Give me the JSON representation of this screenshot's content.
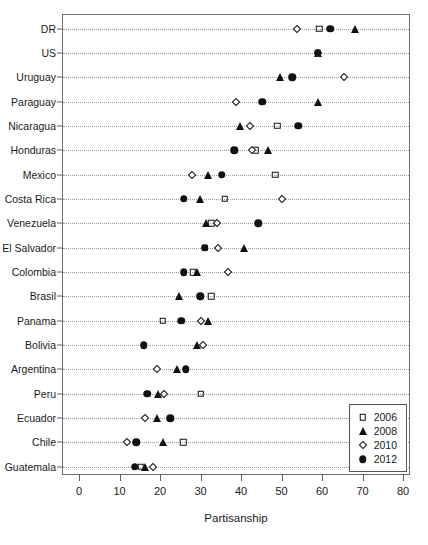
{
  "chart_data": {
    "type": "scatter",
    "title": "",
    "xlabel": "Partisanship",
    "ylabel": "",
    "xlim": [
      0,
      80
    ],
    "xticks": [
      0,
      10,
      20,
      30,
      40,
      50,
      60,
      70,
      80
    ],
    "grid": "horizontal-dotted",
    "legend_position": "bottom-right",
    "categories": [
      "DR",
      "US",
      "Uruguay",
      "Paraguay",
      "Nicaragua",
      "Honduras",
      "Mexico",
      "Costa Rica",
      "Venezuela",
      "El Salvador",
      "Colombia",
      "Brasil",
      "Panama",
      "Bolivia",
      "Argentina",
      "Peru",
      "Ecuador",
      "Chile",
      "Guatemala"
    ],
    "series": [
      {
        "name": "2006",
        "marker": "open-square",
        "values": [
          59.3,
          59.0,
          null,
          null,
          48.9,
          43.7,
          48.4,
          36.0,
          32.6,
          31.1,
          28.1,
          32.6,
          20.7,
          null,
          null,
          30.1,
          null,
          25.7,
          15.3
        ]
      },
      {
        "name": "2008",
        "marker": "filled-triangle",
        "values": [
          68.1,
          59.0,
          49.6,
          59.0,
          39.8,
          46.7,
          31.9,
          29.9,
          31.4,
          40.7,
          29.1,
          24.7,
          31.9,
          29.1,
          24.2,
          19.5,
          19.3,
          20.7,
          16.3
        ]
      },
      {
        "name": "2010",
        "marker": "open-diamond",
        "values": [
          53.8,
          59.0,
          65.4,
          38.8,
          42.2,
          42.7,
          27.9,
          50.1,
          34.1,
          34.3,
          36.8,
          null,
          30.1,
          30.6,
          19.3,
          21.0,
          16.3,
          11.9,
          18.3
        ]
      },
      {
        "name": "2012",
        "marker": "filled-circle",
        "values": [
          62.0,
          59.0,
          52.6,
          45.2,
          54.1,
          38.3,
          35.3,
          25.9,
          44.2,
          31.1,
          25.9,
          29.9,
          25.2,
          16.0,
          26.4,
          16.8,
          22.5,
          14.1,
          13.8
        ]
      }
    ]
  },
  "legend": {
    "items": [
      {
        "label": "2006",
        "marker": "open-square"
      },
      {
        "label": "2008",
        "marker": "filled-triangle"
      },
      {
        "label": "2010",
        "marker": "open-diamond"
      },
      {
        "label": "2012",
        "marker": "filled-circle"
      }
    ]
  },
  "colors": {
    "marker": "#111111",
    "axis": "#5e5e5e",
    "grid": "#9a9a9a",
    "background": "#ffffff"
  }
}
